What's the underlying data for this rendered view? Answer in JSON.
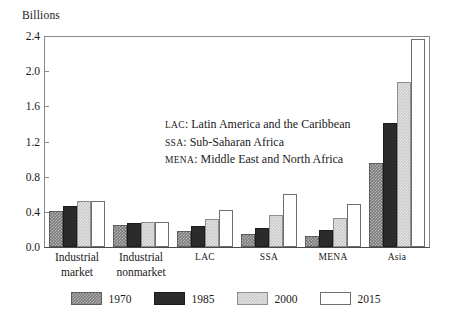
{
  "chart_data": {
    "type": "bar",
    "title": "",
    "ylabel": "Billions",
    "xlabel": "",
    "ylim": [
      0,
      2.4
    ],
    "yticks": [
      "0.0",
      "0.4",
      "0.8",
      "1.2",
      "1.6",
      "2.0",
      "2.4"
    ],
    "grid": false,
    "legend_position": "bottom",
    "categories": [
      "Industrial market",
      "Industrial nonmarket",
      "LAC",
      "SSA",
      "MENA",
      "Asia"
    ],
    "category_lines": [
      [
        "Industrial",
        "market"
      ],
      [
        "Industrial",
        "nonmarket"
      ],
      [
        "LAC",
        ""
      ],
      [
        "SSA",
        ""
      ],
      [
        "MENA",
        ""
      ],
      [
        "Asia",
        ""
      ]
    ],
    "series": [
      {
        "name": "1970",
        "color": "#7d7d7d",
        "values": [
          0.41,
          0.25,
          0.18,
          0.15,
          0.13,
          0.96
        ]
      },
      {
        "name": "1985",
        "color": "#2b2b2b",
        "values": [
          0.47,
          0.27,
          0.24,
          0.22,
          0.19,
          1.41
        ]
      },
      {
        "name": "2000",
        "color": "#cacaca",
        "values": [
          0.52,
          0.29,
          0.32,
          0.36,
          0.33,
          1.88
        ]
      },
      {
        "name": "2015",
        "color": "#ffffff",
        "values": [
          0.52,
          0.29,
          0.42,
          0.6,
          0.49,
          2.37
        ]
      }
    ],
    "annotations": [
      {
        "abbr": "LAC",
        "text": ": Latin America and the Caribbean"
      },
      {
        "abbr": "SSA",
        "text": ": Sub-Saharan Africa"
      },
      {
        "abbr": "MENA",
        "text": ": Middle East and North Africa"
      }
    ]
  }
}
